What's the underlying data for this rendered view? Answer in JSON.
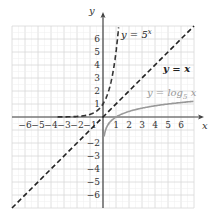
{
  "chart_data": {
    "type": "line",
    "title": "",
    "xlabel": "x",
    "ylabel": "y",
    "xlim": [
      -7,
      7
    ],
    "ylim": [
      -7,
      7
    ],
    "grid": true,
    "x_ticks": [
      "-6",
      "-5",
      "-4",
      "-3",
      "-2",
      "-1",
      "1",
      "2",
      "3",
      "4",
      "5",
      "6"
    ],
    "y_ticks_pos": [
      "1",
      "2",
      "3",
      "4",
      "5",
      "6"
    ],
    "y_ticks_neg": [
      "-2",
      "-3",
      "-4",
      "-5",
      "-6"
    ],
    "series": [
      {
        "name": "y = 5^x",
        "label_main": "y = 5",
        "label_sup": "x",
        "style": "dashed",
        "color": "#333333",
        "x": [
          -3,
          -2,
          -1,
          0,
          0.5,
          1,
          1.1
        ],
        "values": [
          0.008,
          0.04,
          0.2,
          1,
          2.24,
          5,
          5.87
        ]
      },
      {
        "name": "y = x",
        "label": "y = x",
        "style": "dashed",
        "color": "#222222",
        "x": [
          -7,
          7
        ],
        "values": [
          -7,
          7
        ]
      },
      {
        "name": "y = log_5 x",
        "label_main": "y = log",
        "label_sub": "5",
        "label_tail": " x",
        "style": "solid",
        "color": "#999999",
        "x": [
          0.008,
          0.04,
          0.2,
          1,
          5,
          7
        ],
        "values": [
          -3,
          -2,
          -1,
          0,
          1,
          1.21
        ]
      }
    ],
    "legend_position": "inline annotations"
  }
}
